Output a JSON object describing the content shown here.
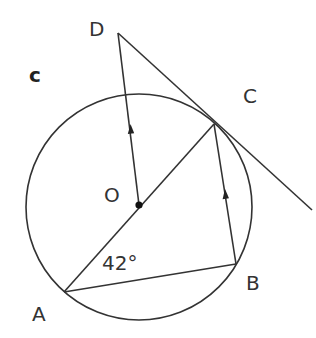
{
  "diagram": {
    "part_label": "c",
    "circle": {
      "center_label": "O",
      "cx": 139,
      "cy": 207,
      "r": 113
    },
    "points": {
      "A": {
        "label": "A",
        "x": 64,
        "y": 292
      },
      "B": {
        "label": "B",
        "x": 236,
        "y": 264
      },
      "C": {
        "label": "C",
        "x": 214,
        "y": 124
      },
      "D": {
        "label": "D",
        "x": 118,
        "y": 33
      },
      "O": {
        "label": "O",
        "x": 139,
        "y": 205
      }
    },
    "angle_label": "42°",
    "segments": [
      "AC (through O)",
      "AB",
      "BC",
      "OD",
      "DC tangent"
    ],
    "parallel_arrows": [
      "OD",
      "BC"
    ],
    "stroke_color": "#333333"
  }
}
